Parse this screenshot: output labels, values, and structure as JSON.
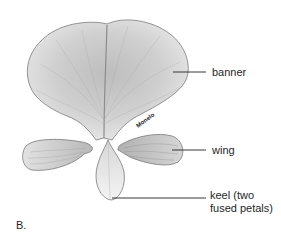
{
  "figure": {
    "panel_label": "B.",
    "signature": "Monelo",
    "labels": {
      "banner": "banner",
      "wing": "wing",
      "keel_line1": "keel (two",
      "keel_line2": "fused petals)"
    },
    "parts": [
      "banner",
      "wing",
      "keel"
    ],
    "colors": {
      "petal_fill": "#d9d9d9",
      "petal_shade": "#9a9a9a",
      "outline": "#6e6e6e",
      "leader_line": "#222222"
    }
  }
}
